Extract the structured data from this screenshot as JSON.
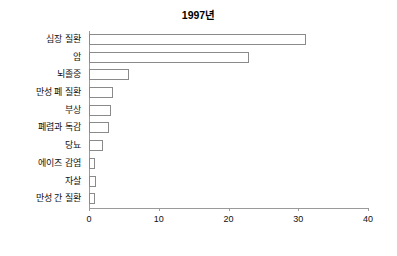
{
  "chart_data": {
    "type": "bar",
    "orientation": "horizontal",
    "title": "1997년",
    "xlabel": "",
    "ylabel": "",
    "xlim": [
      0,
      40
    ],
    "xticks": [
      0,
      10,
      20,
      30,
      40
    ],
    "xtick_labels": [
      "0",
      "10",
      "20",
      "30",
      "40"
    ],
    "grid": false,
    "legend": null,
    "bar_face_color": "#ffffff",
    "bar_edge_color": "#8a8a8a",
    "axis_color": "#9a9a9a",
    "categories": [
      "심장 질환",
      "암",
      "뇌졸중",
      "만성 폐 질환",
      "부상",
      "폐렴과 독감",
      "당뇨",
      "에이즈 감염",
      "자살",
      "만성 간 질환"
    ],
    "values": [
      31.1,
      22.9,
      5.7,
      3.4,
      3.2,
      2.9,
      2.0,
      0.9,
      1.0,
      0.9
    ]
  }
}
